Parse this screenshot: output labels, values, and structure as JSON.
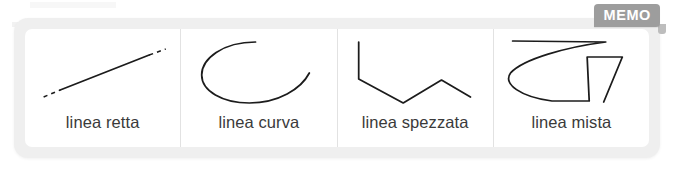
{
  "badge": {
    "label": "MEMO",
    "background_color": "#9d9d9d",
    "text_color": "#ffffff"
  },
  "frame": {
    "background_color": "#efefef",
    "card_background_color": "#ffffff",
    "divider_color": "#e2e2e2"
  },
  "stroke": {
    "color": "#1c1c1c"
  },
  "cells": [
    {
      "id": "linea-retta",
      "label": "linea retta",
      "figure": "straight-line-with-dashed-extensions"
    },
    {
      "id": "linea-curva",
      "label": "linea curva",
      "figure": "open-curve"
    },
    {
      "id": "linea-spezzata",
      "label": "linea spezzata",
      "figure": "zigzag-polyline"
    },
    {
      "id": "linea-mista",
      "label": "linea mista",
      "figure": "mixed-straight-and-curved-line"
    }
  ]
}
